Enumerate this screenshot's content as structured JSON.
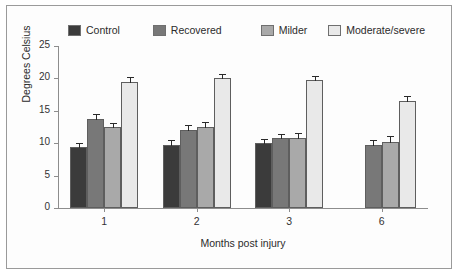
{
  "chart_data": {
    "type": "bar",
    "title": "",
    "xlabel": "Months post injury",
    "ylabel": "Degrees Celsius",
    "categories": [
      "1",
      "2",
      "3",
      "6"
    ],
    "ylim": [
      0,
      25
    ],
    "yticks": [
      0,
      5,
      10,
      15,
      20,
      25
    ],
    "grid": false,
    "legend_position": "top",
    "series": [
      {
        "name": "Control",
        "color": "#3b3b3b",
        "values": [
          9.4,
          9.8,
          10.1,
          null
        ],
        "errors": [
          0.55,
          0.6,
          0.45,
          null
        ]
      },
      {
        "name": "Recovered",
        "color": "#787878",
        "values": [
          13.8,
          12.1,
          10.8,
          9.8
        ],
        "errors": [
          0.55,
          0.5,
          0.5,
          0.5
        ]
      },
      {
        "name": "Milder",
        "color": "#a9a9a9",
        "values": [
          12.5,
          12.5,
          10.8,
          10.2
        ],
        "errors": [
          0.5,
          0.55,
          0.55,
          0.7
        ]
      },
      {
        "name": "Moderate/severe",
        "color": "#e9e9e9",
        "values": [
          19.5,
          20.1,
          19.7,
          16.5
        ],
        "errors": [
          0.55,
          0.5,
          0.5,
          0.6
        ]
      }
    ]
  },
  "legend": {
    "items": [
      {
        "label": "Control",
        "color": "#3b3b3b"
      },
      {
        "label": "Recovered",
        "color": "#787878"
      },
      {
        "label": "Milder",
        "color": "#a9a9a9"
      },
      {
        "label": "Moderate/severe",
        "color": "#e9e9e9"
      }
    ]
  },
  "axes": {
    "y_label": "Degrees Celsius",
    "x_label": "Months post injury",
    "y_tick_labels": [
      "25",
      "20",
      "15",
      "10",
      "5",
      "0"
    ],
    "x_tick_labels": [
      "1",
      "2",
      "3",
      "6"
    ]
  }
}
